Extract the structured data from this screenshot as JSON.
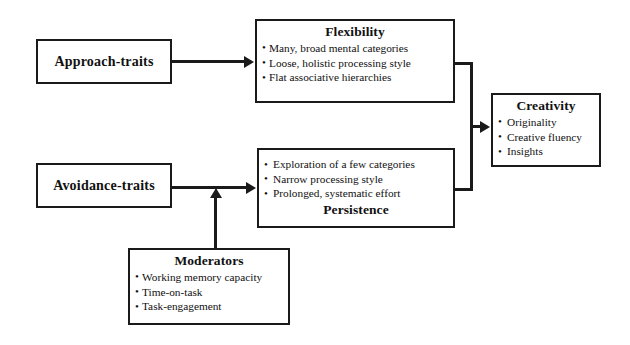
{
  "diagram": {
    "type": "flowchart",
    "title_text": "Dual Pathway to Creativity Model",
    "nodes": {
      "approach_traits": {
        "label": "Approach-traits"
      },
      "avoidance_traits": {
        "label": "Avoidance-traits"
      },
      "flexibility": {
        "title": "Flexibility",
        "title_position": "top",
        "bullets": [
          "Many, broad mental categories",
          "Loose, holistic processing style",
          "Flat associative hierarchies"
        ]
      },
      "persistence": {
        "title": "Persistence",
        "title_position": "bottom",
        "bullets": [
          "Exploration of a few categories",
          "Narrow processing style",
          "Prolonged, systematic effort"
        ]
      },
      "creativity": {
        "title": "Creativity",
        "title_position": "top",
        "bullets": [
          "Originality",
          "Creative fluency",
          "Insights"
        ]
      },
      "moderators": {
        "title": "Moderators",
        "title_position": "top",
        "bullets": [
          "Working memory capacity",
          "Time-on-task",
          "Task-engagement"
        ]
      }
    },
    "edges": [
      {
        "from": "approach_traits",
        "to": "flexibility",
        "style": "arrow-right"
      },
      {
        "from": "avoidance_traits",
        "to": "persistence",
        "style": "arrow-right"
      },
      {
        "from": "flexibility",
        "to": "creativity",
        "style": "elbow-merge-arrow"
      },
      {
        "from": "persistence",
        "to": "creativity",
        "style": "elbow-merge-arrow"
      },
      {
        "from": "moderators",
        "to": "avoidance-persistence-link",
        "style": "arrow-up"
      }
    ],
    "colors": {
      "stroke": "#1a1a1a",
      "background": "#ffffff",
      "text": "#111111"
    }
  }
}
